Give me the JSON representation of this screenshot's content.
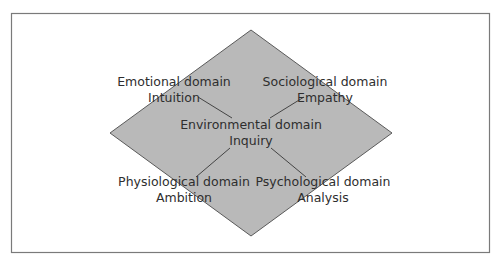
{
  "diagram": {
    "type": "diamond-domains",
    "colors": {
      "background": "#ffffff",
      "frame_border": "#7a7a7a",
      "diamond_fill": "#b9b9b9",
      "diamond_stroke": "#5a5a5a",
      "connector": "#444444",
      "text": "#2e2e2e"
    },
    "center": {
      "domain": "Environmental domain",
      "trait": "Inquiry"
    },
    "nodes": [
      {
        "position": "top-left",
        "domain": "Emotional domain",
        "trait": "Intuition"
      },
      {
        "position": "top-right",
        "domain": "Sociological domain",
        "trait": "Empathy"
      },
      {
        "position": "bottom-left",
        "domain": "Physiological domain",
        "trait": "Ambition"
      },
      {
        "position": "bottom-right",
        "domain": "Psychological domain",
        "trait": "Analysis"
      }
    ]
  }
}
